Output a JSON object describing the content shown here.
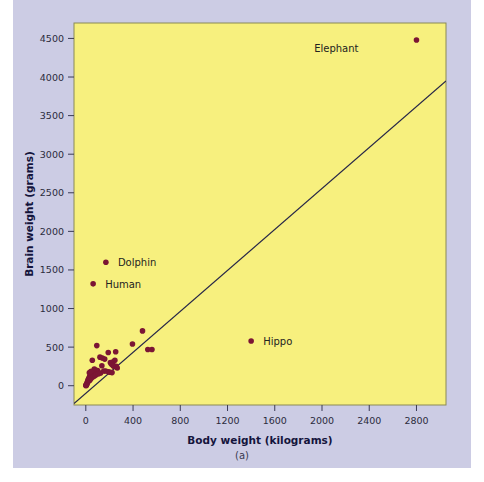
{
  "figure": {
    "caption": "(a)",
    "panel_bg": "#ccccE4",
    "plot_bg": "#F7F07E",
    "plot_border": "#8a8a55",
    "point_color": "#7B1534",
    "line_color": "#262648",
    "text_color": "#14143c"
  },
  "chart_data": {
    "type": "scatter",
    "title": "",
    "xlabel": "Body weight (kilograms)",
    "ylabel": "Brain weight (grams)",
    "xlim": [
      -100,
      3050
    ],
    "ylim": [
      -250,
      4700
    ],
    "xticks": [
      0,
      400,
      800,
      1200,
      1600,
      2000,
      2400,
      2800
    ],
    "xticklabels": [
      "0",
      "400",
      "800",
      "1200",
      "1600",
      "2000",
      "2400",
      "2800"
    ],
    "yticks": [
      0,
      500,
      1000,
      1500,
      2000,
      2500,
      3000,
      3500,
      4000,
      4500
    ],
    "yticklabels": [
      "0",
      "500",
      "1000",
      "1500",
      "2000",
      "2500",
      "3000",
      "3500",
      "4000",
      "4500"
    ],
    "grid": false,
    "legend": "none",
    "annotations": [
      {
        "label": "Elephant",
        "x": 2800,
        "y": 4480,
        "label_dx": -58,
        "label_dy": 12
      },
      {
        "label": "Dolphin",
        "x": 170,
        "y": 1600,
        "label_dx": 12,
        "label_dy": 4
      },
      {
        "label": "Human",
        "x": 62,
        "y": 1320,
        "label_dx": 12,
        "label_dy": 4
      },
      {
        "label": "Hippo",
        "x": 1400,
        "y": 580,
        "label_dx": 12,
        "label_dy": 4
      }
    ],
    "trendline": {
      "x": [
        -100,
        3050
      ],
      "y": [
        -230,
        3950
      ]
    },
    "points": [
      {
        "x": 2800,
        "y": 4480
      },
      {
        "x": 170,
        "y": 1600
      },
      {
        "x": 62,
        "y": 1320
      },
      {
        "x": 1400,
        "y": 580
      },
      {
        "x": 480,
        "y": 710
      },
      {
        "x": 395,
        "y": 540
      },
      {
        "x": 525,
        "y": 470
      },
      {
        "x": 560,
        "y": 470
      },
      {
        "x": 93,
        "y": 520
      },
      {
        "x": 253,
        "y": 440
      },
      {
        "x": 190,
        "y": 430
      },
      {
        "x": 55,
        "y": 330
      },
      {
        "x": 120,
        "y": 370
      },
      {
        "x": 140,
        "y": 360
      },
      {
        "x": 160,
        "y": 345
      },
      {
        "x": 232,
        "y": 310
      },
      {
        "x": 246,
        "y": 330
      },
      {
        "x": 208,
        "y": 300
      },
      {
        "x": 216,
        "y": 280
      },
      {
        "x": 228,
        "y": 265
      },
      {
        "x": 238,
        "y": 250
      },
      {
        "x": 258,
        "y": 250
      },
      {
        "x": 266,
        "y": 230
      },
      {
        "x": 192,
        "y": 180
      },
      {
        "x": 205,
        "y": 175
      },
      {
        "x": 222,
        "y": 170
      },
      {
        "x": 152,
        "y": 190
      },
      {
        "x": 168,
        "y": 190
      },
      {
        "x": 100,
        "y": 195
      },
      {
        "x": 86,
        "y": 200
      },
      {
        "x": 72,
        "y": 215
      },
      {
        "x": 62,
        "y": 175
      },
      {
        "x": 55,
        "y": 160
      },
      {
        "x": 48,
        "y": 150
      },
      {
        "x": 42,
        "y": 140
      },
      {
        "x": 36,
        "y": 125
      },
      {
        "x": 32,
        "y": 115
      },
      {
        "x": 28,
        "y": 100
      },
      {
        "x": 24,
        "y": 88
      },
      {
        "x": 20,
        "y": 75
      },
      {
        "x": 18,
        "y": 62
      },
      {
        "x": 15,
        "y": 50
      },
      {
        "x": 12,
        "y": 40
      },
      {
        "x": 10,
        "y": 28
      },
      {
        "x": 8,
        "y": 18
      },
      {
        "x": 6,
        "y": 12
      },
      {
        "x": 4,
        "y": 8
      },
      {
        "x": 3,
        "y": 5
      },
      {
        "x": 2,
        "y": 4
      },
      {
        "x": 1,
        "y": 2
      },
      {
        "x": 30,
        "y": 168
      },
      {
        "x": 38,
        "y": 178
      },
      {
        "x": 46,
        "y": 188
      },
      {
        "x": 26,
        "y": 60
      },
      {
        "x": 34,
        "y": 70
      },
      {
        "x": 44,
        "y": 95
      },
      {
        "x": 52,
        "y": 108
      },
      {
        "x": 66,
        "y": 120
      },
      {
        "x": 78,
        "y": 132
      },
      {
        "x": 90,
        "y": 145
      },
      {
        "x": 108,
        "y": 155
      },
      {
        "x": 125,
        "y": 165
      },
      {
        "x": 136,
        "y": 258
      }
    ]
  }
}
